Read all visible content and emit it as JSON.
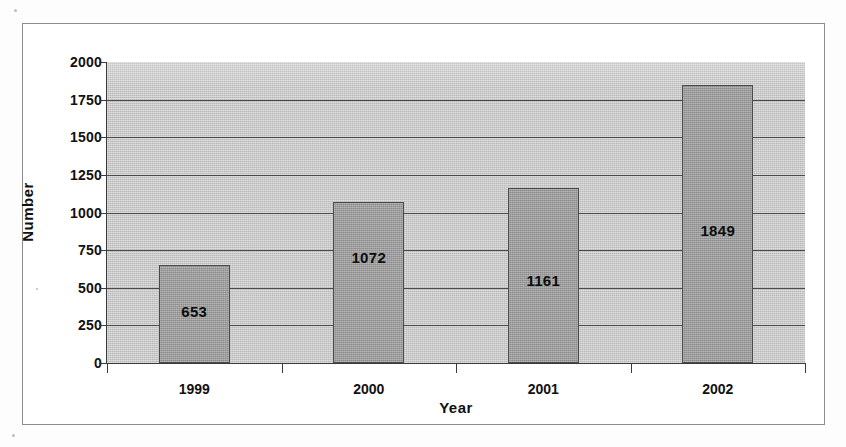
{
  "chart_data": {
    "type": "bar",
    "title": "",
    "xlabel": "Year",
    "ylabel": "Number",
    "categories": [
      "1999",
      "2000",
      "2001",
      "2002"
    ],
    "values": [
      653,
      1072,
      1161,
      1849
    ],
    "value_labels": [
      "653",
      "1072",
      "1161",
      "1849"
    ],
    "ylim": [
      0,
      2000
    ],
    "ytick_labels": [
      "2000",
      "1750",
      "1500",
      "1250",
      "1000",
      "750",
      "500",
      "250",
      "0"
    ],
    "ytick_values": [
      2000,
      1750,
      1500,
      1250,
      1000,
      750,
      500,
      250,
      0
    ],
    "ytick_step": 250,
    "grid": true,
    "grid_axis": "y",
    "legend": "none",
    "series": [
      {
        "name": "Number",
        "values": [
          653,
          1072,
          1161,
          1849
        ]
      }
    ],
    "colors": {
      "bar_fill": "#9c9c9c",
      "bar_border": "#4a4a4a",
      "plot_background": "#c9c9c9",
      "gridline": "#4a4a4a",
      "axis": "#3a3a3a",
      "text": "#111111",
      "page_background": "#ffffff",
      "frame_border": "#8c8c8c"
    }
  }
}
